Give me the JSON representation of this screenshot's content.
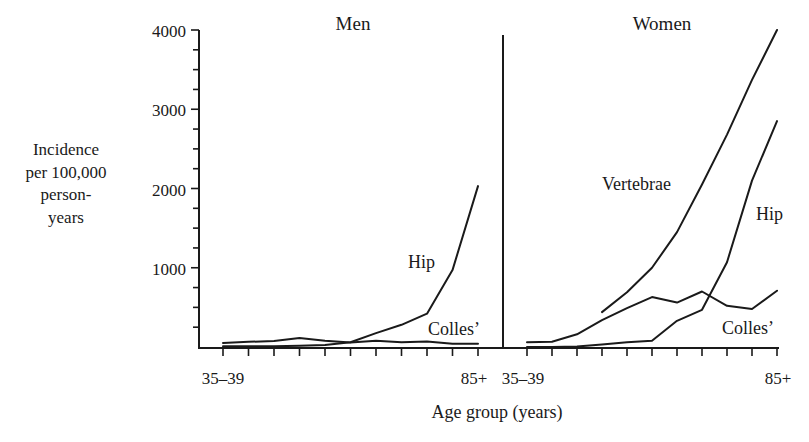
{
  "chart_data": {
    "type": "line",
    "title": "",
    "xlabel": "Age group (years)",
    "ylabel": "Incidence per 100,000 person-years",
    "ylabel_lines": [
      "Incidence",
      "per 100,000",
      "person-",
      "years"
    ],
    "ylim": [
      0,
      4000
    ],
    "yticks_major": [
      1000,
      2000,
      3000,
      4000
    ],
    "ytick_labels": [
      "1000",
      "2000",
      "3000",
      "4000"
    ],
    "yminor_step": 250,
    "grid": false,
    "legend": "inline labels",
    "categories": [
      "35-39",
      "40-44",
      "45-49",
      "50-54",
      "55-59",
      "60-64",
      "65-69",
      "70-74",
      "75-79",
      "80-84",
      "85+"
    ],
    "xtick_labels_shown": {
      "first": "35–39",
      "last": "85+"
    },
    "panels": [
      {
        "name": "Men",
        "title": "Men",
        "series": [
          {
            "name": "Hip",
            "label": "Hip",
            "values": [
              10,
              10,
              10,
              15,
              25,
              60,
              175,
              280,
              420,
              970,
              2030
            ]
          },
          {
            "name": "Colles'",
            "label": "Colles’",
            "values": [
              50,
              65,
              75,
              115,
              80,
              55,
              80,
              60,
              70,
              40,
              40
            ]
          }
        ]
      },
      {
        "name": "Women",
        "title": "Women",
        "series": [
          {
            "name": "Vertebrae",
            "label": "Vertebrae",
            "values": [
              null,
              null,
              null,
              440,
              690,
              1000,
              1450,
              2050,
              2680,
              3370,
              4000
            ]
          },
          {
            "name": "Hip",
            "label": "Hip",
            "values": [
              0,
              0,
              5,
              30,
              60,
              80,
              330,
              470,
              1070,
              2100,
              2850
            ]
          },
          {
            "name": "Colles'",
            "label": "Colles’",
            "values": [
              60,
              65,
              160,
              340,
              490,
              630,
              560,
              700,
              520,
              480,
              710
            ]
          }
        ]
      }
    ]
  },
  "labels": {
    "men_title": "Men",
    "women_title": "Women",
    "y_axis_line1": "Incidence",
    "y_axis_line2": "per 100,000",
    "y_axis_line3": "person-",
    "y_axis_line4": "years",
    "x_axis_title": "Age group (years)",
    "men_first_tick": "35–39",
    "men_last_tick": "85+",
    "women_first_tick": "35–39",
    "women_last_tick": "85+",
    "y4000": "4000",
    "y3000": "3000",
    "y2000": "2000",
    "y1000": "1000",
    "men_hip": "Hip",
    "men_colles": "Colles’",
    "women_vertebrae": "Vertebrae",
    "women_hip": "Hip",
    "women_colles": "Colles’"
  }
}
